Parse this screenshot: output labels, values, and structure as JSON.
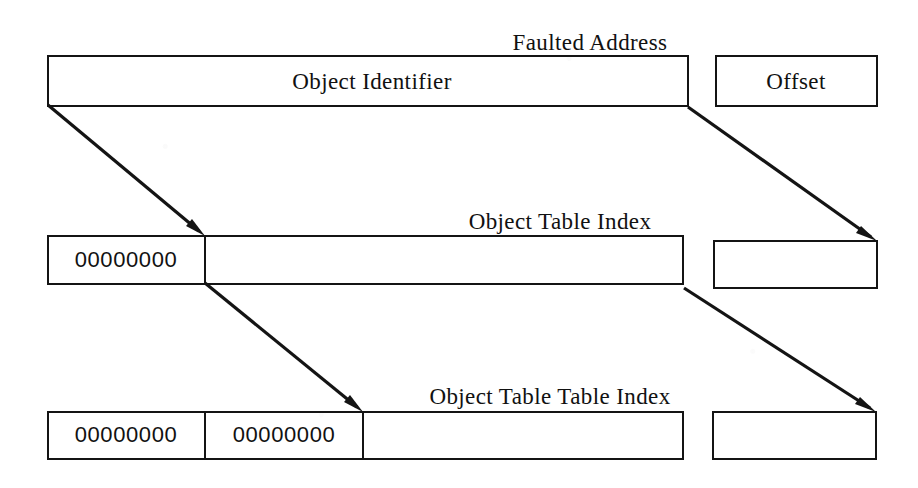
{
  "diagram": {
    "background_color": "#ffffff",
    "ink_color": "#141414",
    "rows": [
      {
        "id": "row-faulted-address",
        "top_label": "Faulted   Address",
        "bar_label": "Object Identifier",
        "right_box_label": "Offset",
        "cells": []
      },
      {
        "id": "row-object-table-index",
        "top_label": "Object Table Index",
        "bar_label": "",
        "right_box_label": "",
        "cells": [
          "00000000"
        ]
      },
      {
        "id": "row-object-table-table-index",
        "top_label": "Object Table Table Index",
        "bar_label": "",
        "right_box_label": "",
        "cells": [
          "00000000",
          "00000000"
        ]
      }
    ],
    "arrows": [
      {
        "id": "arrow-left-1",
        "from": "faulted-address-bar-left",
        "to": "object-table-index-cell-1-right"
      },
      {
        "id": "arrow-left-2",
        "from": "object-table-index-cell-1-right",
        "to": "object-table-table-index-cell-2-right"
      },
      {
        "id": "arrow-right-1",
        "from": "faulted-address-bar-right",
        "to": "object-table-index-right-box"
      },
      {
        "id": "arrow-right-2",
        "from": "object-table-index-bar-right",
        "to": "object-table-table-index-right-box"
      }
    ]
  }
}
